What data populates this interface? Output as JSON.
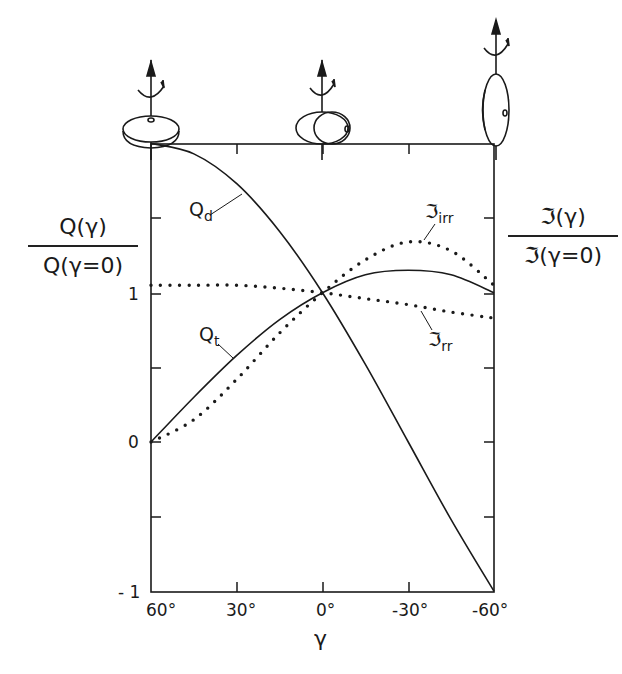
{
  "chart_data": {
    "type": "line",
    "title": "",
    "xlabel": "γ",
    "ylabel_left": {
      "numerator": "Q(γ)",
      "denominator": "Q(γ=0)"
    },
    "ylabel_right": {
      "numerator": "ℑ(γ)",
      "denominator": "ℑ(γ=0)"
    },
    "x": [
      60,
      45,
      30,
      15,
      0,
      -15,
      -30,
      -45,
      -60
    ],
    "x_tick_labels": [
      "60°",
      "30°",
      "0°",
      "-30°",
      "-60°"
    ],
    "x_ticks": [
      60,
      30,
      0,
      -30,
      -60
    ],
    "y_tick_labels": [
      "1",
      "0",
      "- 1"
    ],
    "y_ticks": [
      -1,
      -0.5,
      0,
      0.5,
      1,
      1.5,
      2
    ],
    "xlim": [
      60,
      -60
    ],
    "ylim": [
      -1,
      2
    ],
    "grid": false,
    "series": [
      {
        "name": "Q_d",
        "style": "solid",
        "values": [
          2.0,
          1.93,
          1.73,
          1.41,
          1.0,
          0.52,
          0.0,
          -0.52,
          -1.0
        ]
      },
      {
        "name": "Q_t",
        "style": "solid",
        "values": [
          0.0,
          0.3,
          0.58,
          0.82,
          1.0,
          1.12,
          1.15,
          1.12,
          1.0
        ]
      },
      {
        "name": "ℑ_irr",
        "style": "dotted",
        "values": [
          0.0,
          0.15,
          0.42,
          0.73,
          1.0,
          1.22,
          1.34,
          1.28,
          1.05
        ]
      },
      {
        "name": "ℑ_rr",
        "style": "dotted",
        "values": [
          1.05,
          1.05,
          1.05,
          1.03,
          1.0,
          0.96,
          0.92,
          0.87,
          0.83
        ]
      }
    ],
    "curve_labels": {
      "qd": "Q",
      "qd_sub": "d",
      "qt": "Q",
      "qt_sub": "t",
      "irr": "ℑ",
      "irr_sub": "irr",
      "rr": "ℑ",
      "rr_sub": "rr"
    },
    "annotations": [
      "oblate spinning disk at γ=60°",
      "triaxial ellipsoid at γ=0°",
      "disk rotating about in-plane axis at γ=-60°"
    ]
  }
}
